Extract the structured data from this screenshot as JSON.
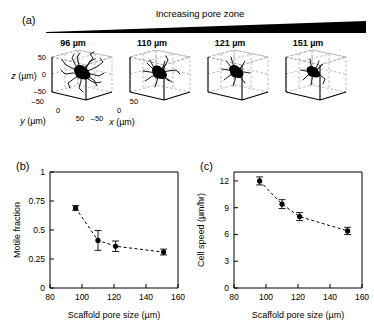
{
  "figure": {
    "panels": [
      "(a)",
      "(b)",
      "(c)"
    ],
    "banner_label": "Increasing pore zone",
    "banner_color": "#000000"
  },
  "panel_a": {
    "letter": "(a)",
    "pore_sizes": [
      "96 µm",
      "110 µm",
      "121 µm",
      "151 µm"
    ],
    "z_axis_label": "z (µm)",
    "y_axis_label": "y (µm)",
    "x_axis_label": "x (µm)",
    "z_ticks": [
      "50",
      "0",
      "–50"
    ],
    "y_ticks": [
      "–50",
      "0",
      "50"
    ],
    "x_ticks": [
      "–50",
      "0",
      "50"
    ]
  },
  "panel_b": {
    "letter": "(b)"
  },
  "panel_c": {
    "letter": "(c)"
  },
  "chart_data": [
    {
      "type": "line",
      "panel": "(b)",
      "title": "",
      "xlabel": "Scaffold pore size (µm)",
      "ylabel": "Motile fraction",
      "xlim": [
        80,
        160
      ],
      "ylim": [
        0,
        1
      ],
      "xticks": [
        80,
        100,
        120,
        140,
        160
      ],
      "xtick_labels": [
        "80",
        "100",
        "120",
        "140",
        "160"
      ],
      "yticks": [
        0,
        0.25,
        0.5,
        0.75,
        1
      ],
      "ytick_labels": [
        "0",
        "0.25",
        "0.5",
        "0.75",
        "1"
      ],
      "grid": false,
      "legend": "none",
      "linestyle": "dashed",
      "marker": "circle-filled",
      "x": [
        96,
        110,
        121,
        151
      ],
      "values": [
        0.69,
        0.41,
        0.36,
        0.31
      ],
      "yerr": [
        0.02,
        0.085,
        0.045,
        0.025
      ]
    },
    {
      "type": "line",
      "panel": "(c)",
      "title": "",
      "xlabel": "Scaffold pore size (µm)",
      "ylabel": "Cell speed (µm/hr)",
      "xlim": [
        80,
        160
      ],
      "ylim": [
        0,
        13
      ],
      "xticks": [
        80,
        100,
        120,
        140,
        160
      ],
      "xtick_labels": [
        "80",
        "100",
        "120",
        "140",
        "160"
      ],
      "yticks": [
        0,
        3,
        6,
        9,
        12
      ],
      "ytick_labels": [
        "0",
        "3",
        "6",
        "9",
        "12"
      ],
      "grid": false,
      "legend": "none",
      "linestyle": "dashed",
      "marker": "circle-filled",
      "x": [
        96,
        110,
        121,
        151
      ],
      "values": [
        12.0,
        9.4,
        8.0,
        6.4
      ],
      "yerr": [
        0.45,
        0.5,
        0.45,
        0.4
      ]
    }
  ]
}
